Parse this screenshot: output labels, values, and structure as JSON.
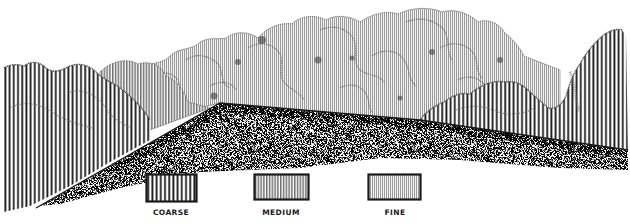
{
  "diagram": {
    "colors": {
      "ink": "#1a1a1a",
      "paper": "#ffffff",
      "stipple": "#555555"
    },
    "legend": {
      "items": [
        {
          "id": "coarse",
          "label": "COARSE",
          "line_spacing_px": 4.2,
          "line_width_px": 1.8
        },
        {
          "id": "medium",
          "label": "MEDIUM",
          "line_spacing_px": 2.8,
          "line_width_px": 1.0
        },
        {
          "id": "fine",
          "label": "FINE",
          "line_spacing_px": 2.0,
          "line_width_px": 0.7
        }
      ]
    },
    "regions": [
      {
        "id": "left-hedge",
        "texture": "coarse"
      },
      {
        "id": "background-trees",
        "texture": "fine"
      },
      {
        "id": "right-hedge",
        "texture": "coarse"
      },
      {
        "id": "ground-plane",
        "texture": "stipple"
      }
    ]
  }
}
